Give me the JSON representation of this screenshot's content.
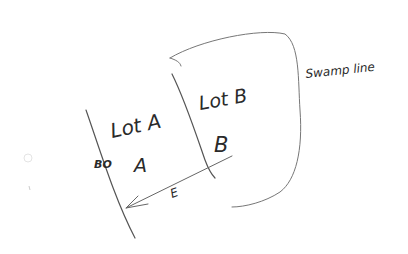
{
  "diagram": {
    "type": "hand-drawn sketch",
    "labels": {
      "lot_a_title": "Lot A",
      "lot_b_title": "Lot B",
      "lot_a_letter": "A",
      "lot_b_letter": "B",
      "left_marker": "BO",
      "arrow_label": "E",
      "swamp_label": "Swamp line"
    },
    "colors": {
      "ink_dark": "#2a2a2a",
      "ink_light": "#8a8a8a",
      "background": "#ffffff"
    }
  }
}
